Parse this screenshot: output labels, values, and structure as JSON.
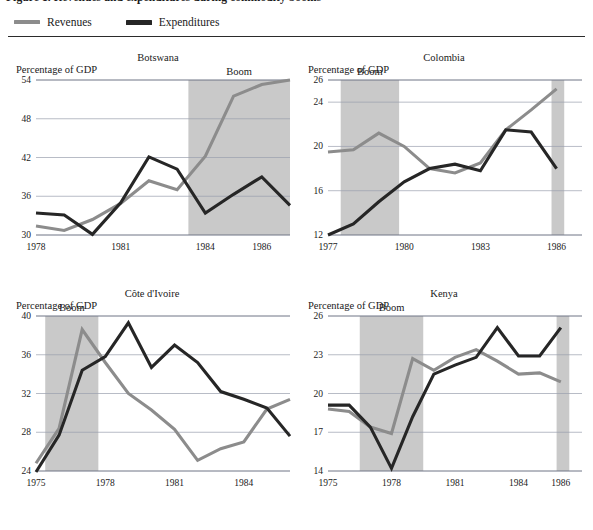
{
  "figure": {
    "title": "Figure 1. Revenues and expenditures during commodity booms",
    "axis_caption": "Percentage of GDP",
    "boom_label": "Boom",
    "legend": [
      {
        "label": "Revenues",
        "key": "revenues",
        "color": "#8c8c8c",
        "swatch": "line-swatch-gray"
      },
      {
        "label": "Expenditures",
        "key": "expenditures",
        "color": "#262626",
        "swatch": "line-swatch-dark"
      }
    ],
    "band_color": "#c9c9c9",
    "grid_color": "#9a9fae"
  },
  "chart_data": [
    {
      "type": "line",
      "title": "Botswana",
      "xlabel": "",
      "ylabel": "Percentage of GDP",
      "ylim": [
        30,
        54
      ],
      "yticks": [
        30,
        36,
        42,
        48,
        54
      ],
      "xlim": [
        1978,
        1987
      ],
      "xticks": [
        1978,
        1981,
        1984,
        1986
      ],
      "grid": true,
      "legend_position": "figure-top-left",
      "annotations": [
        {
          "text": "Boom",
          "x_start": 1983.4,
          "x_end": 1987
        }
      ],
      "bands": [
        {
          "label": "Boom",
          "x_start": 1983.4,
          "x_end": 1987
        }
      ],
      "x": [
        1978,
        1979,
        1980,
        1981,
        1982,
        1983,
        1984,
        1985,
        1986,
        1987
      ],
      "series": [
        {
          "name": "Revenues",
          "values": [
            31.4,
            30.7,
            32.4,
            34.9,
            38.4,
            37.0,
            42.2,
            51.5,
            53.3,
            54.0
          ]
        },
        {
          "name": "Expenditures",
          "values": [
            33.4,
            33.1,
            30.1,
            35.0,
            42.1,
            40.2,
            33.4,
            36.3,
            39.0,
            34.6
          ]
        }
      ]
    },
    {
      "type": "line",
      "title": "Colombia",
      "xlabel": "",
      "ylabel": "Percentage of GDP",
      "ylim": [
        12,
        26
      ],
      "yticks": [
        12,
        16,
        20,
        24,
        26
      ],
      "xlim": [
        1977,
        1987
      ],
      "xticks": [
        1977,
        1980,
        1983,
        1986
      ],
      "grid": true,
      "legend_position": "figure-top-left",
      "annotations": [
        {
          "text": "Boom",
          "x_start": 1977.5,
          "x_end": 1979.8
        }
      ],
      "bands": [
        {
          "label": "Boom",
          "x_start": 1977.5,
          "x_end": 1979.8
        },
        {
          "label": "",
          "x_start": 1985.8,
          "x_end": 1986.3
        }
      ],
      "x": [
        1977,
        1978,
        1979,
        1980,
        1981,
        1982,
        1983,
        1984,
        1985,
        1986
      ],
      "series": [
        {
          "name": "Revenues",
          "values": [
            19.5,
            19.7,
            21.2,
            20.0,
            18.0,
            17.6,
            18.5,
            21.5,
            23.3,
            25.2
          ]
        },
        {
          "name": "Expenditures",
          "values": [
            12.0,
            13.0,
            15.0,
            16.8,
            18.0,
            18.4,
            17.8,
            21.5,
            21.3,
            18.0
          ]
        }
      ]
    },
    {
      "type": "line",
      "title": "Côte d'Ivoire",
      "xlabel": "",
      "ylabel": "Percentage of GDP",
      "ylim": [
        24,
        40
      ],
      "yticks": [
        24,
        28,
        32,
        36,
        40
      ],
      "xlim": [
        1975,
        1986
      ],
      "xticks": [
        1975,
        1978,
        1981,
        1984
      ],
      "grid": true,
      "legend_position": "figure-top-left",
      "annotations": [
        {
          "text": "Boom",
          "x_start": 1975.4,
          "x_end": 1977.7
        }
      ],
      "bands": [
        {
          "label": "Boom",
          "x_start": 1975.4,
          "x_end": 1977.7
        }
      ],
      "x": [
        1975,
        1976,
        1977,
        1978,
        1979,
        1980,
        1981,
        1982,
        1983,
        1984,
        1985,
        1986
      ],
      "series": [
        {
          "name": "Revenues",
          "values": [
            24.8,
            28.4,
            38.6,
            35.2,
            32.0,
            30.3,
            28.3,
            25.1,
            26.3,
            27.0,
            30.4,
            31.4
          ]
        },
        {
          "name": "Expenditures",
          "values": [
            23.9,
            27.7,
            34.4,
            35.8,
            39.3,
            34.7,
            37.0,
            35.2,
            32.2,
            31.4,
            30.5,
            27.6
          ]
        }
      ]
    },
    {
      "type": "line",
      "title": "Kenya",
      "xlabel": "",
      "ylabel": "Percentage of GDP",
      "ylim": [
        14,
        26
      ],
      "yticks": [
        14,
        17,
        20,
        23,
        26
      ],
      "xlim": [
        1975,
        1987
      ],
      "xticks": [
        1975,
        1978,
        1981,
        1984,
        1986
      ],
      "grid": true,
      "legend_position": "figure-top-left",
      "annotations": [
        {
          "text": "Boom",
          "x_start": 1976.5,
          "x_end": 1979.5
        }
      ],
      "bands": [
        {
          "label": "Boom",
          "x_start": 1976.5,
          "x_end": 1979.5
        },
        {
          "label": "",
          "x_start": 1985.8,
          "x_end": 1986.4
        }
      ],
      "x": [
        1975,
        1976,
        1977,
        1978,
        1979,
        1980,
        1981,
        1982,
        1983,
        1984,
        1985,
        1986
      ],
      "series": [
        {
          "name": "Revenues",
          "values": [
            18.8,
            18.6,
            17.4,
            16.9,
            22.7,
            21.8,
            22.8,
            23.4,
            22.5,
            21.5,
            21.6,
            20.9,
            21.7
          ]
        },
        {
          "name": "Expenditures",
          "values": [
            19.1,
            19.1,
            17.4,
            14.2,
            18.2,
            21.5,
            22.2,
            22.8,
            25.1,
            22.9,
            22.9,
            25.1,
            23.2
          ]
        }
      ]
    }
  ]
}
